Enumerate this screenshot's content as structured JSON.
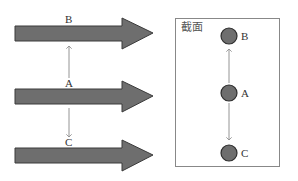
{
  "colors": {
    "arrow_fill": "#6e6e6e",
    "arrow_stroke": "#3a3a3a",
    "circle_fill": "#6e6e6e",
    "circle_stroke": "#2e2e2e",
    "connector": "#888888",
    "box_stroke": "#888888"
  },
  "left_view": {
    "arrows": [
      {
        "id": "B",
        "label": "B",
        "y": 33
      },
      {
        "id": "A",
        "label": "A",
        "y": 96
      },
      {
        "id": "C",
        "label": "C",
        "y": 155
      }
    ],
    "labels": {
      "B": "B",
      "A": "A",
      "C": "C"
    }
  },
  "cross_section": {
    "title": "截面",
    "points": [
      {
        "id": "B",
        "label": "B",
        "y": 36
      },
      {
        "id": "A",
        "label": "A",
        "y": 93
      },
      {
        "id": "C",
        "label": "C",
        "y": 153
      }
    ],
    "labels": {
      "B": "B",
      "A": "A",
      "C": "C"
    }
  }
}
